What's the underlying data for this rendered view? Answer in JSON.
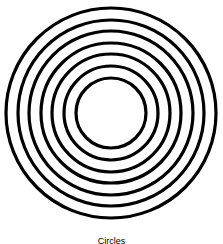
{
  "figure": {
    "shape": "concentric-circles",
    "center": [
      111,
      113
    ],
    "radii": [
      105,
      93,
      82,
      70,
      59,
      47,
      35
    ],
    "stroke_color": "#000000",
    "stroke_width": 3.2,
    "background": "#ffffff"
  },
  "caption": {
    "text": "Circles"
  }
}
